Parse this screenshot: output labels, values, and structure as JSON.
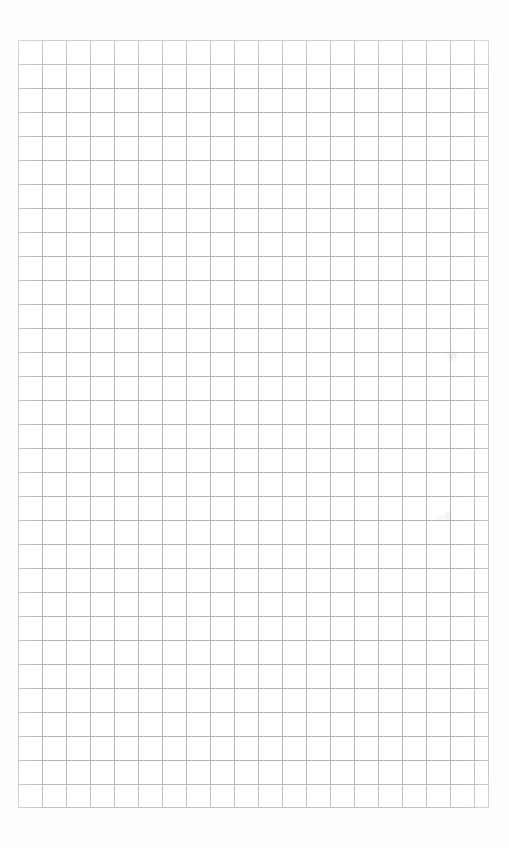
{
  "document": {
    "kind": "grid-paper-scan",
    "title": "Blank Grid Paper",
    "description": "Scanned blank sheet of square grid (graph) paper with no writing, drawings, or printed text.",
    "text_content": "",
    "page_background_color": "#fefefe",
    "paper_tone_color": "#fdfdfd"
  },
  "grid": {
    "style": "square",
    "line_color": "#b4b4b4",
    "border_line_color": "#b9b9b9",
    "cell_size_px": 24,
    "line_width_px": 1,
    "offset_x_px": 18,
    "offset_y_px": 40,
    "width_px": 471,
    "height_px": 768,
    "columns": 20,
    "rows": 32
  },
  "margins": {
    "top_px": 40,
    "bottom_px": 40,
    "left_px": 18,
    "right_px": 20
  },
  "canvas": {
    "width_px": 509,
    "height_px": 848
  },
  "artifacts": [
    {
      "id": "fleck-1",
      "x_px": 448,
      "y_px": 352,
      "size_px": 9,
      "opacity": 0.16
    },
    {
      "id": "fleck-2",
      "x_px": 444,
      "y_px": 512,
      "size_px": 8,
      "opacity": 0.13
    },
    {
      "id": "fleck-3",
      "x_px": 437,
      "y_px": 516,
      "size_px": 5,
      "opacity": 0.11
    },
    {
      "id": "fleck-4",
      "x_px": 190,
      "y_px": 620,
      "size_px": 4,
      "opacity": 0.08
    }
  ]
}
